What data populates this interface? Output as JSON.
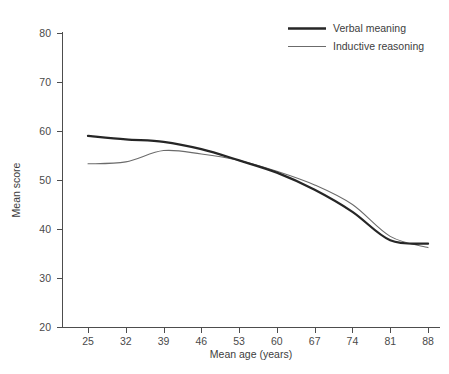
{
  "chart_data": {
    "type": "line",
    "title": "",
    "subtitle": "",
    "xlabel": "Mean age (years)",
    "ylabel": "Mean score",
    "x": [
      25,
      32,
      39,
      46,
      53,
      60,
      67,
      74,
      81,
      88
    ],
    "xtick_labels": [
      "25",
      "32",
      "39",
      "46",
      "53",
      "60",
      "67",
      "74",
      "81",
      "88"
    ],
    "ytick_labels": [
      "20",
      "30",
      "40",
      "50",
      "60",
      "70",
      "80"
    ],
    "yticks": [
      20,
      30,
      40,
      50,
      60,
      70,
      80
    ],
    "xlim": [
      25,
      88
    ],
    "ylim": [
      20,
      80
    ],
    "grid": false,
    "legend_position": "top-right",
    "series": [
      {
        "name": "Verbal meaning",
        "style": "thick",
        "color": "#262626",
        "values": [
          59.0,
          58.3,
          57.8,
          56.3,
          54.0,
          51.5,
          48.0,
          43.5,
          37.7,
          37.0
        ]
      },
      {
        "name": "Inductive reasoning",
        "style": "thin",
        "color": "#6b6b6b",
        "values": [
          53.3,
          53.7,
          56.0,
          55.3,
          54.0,
          51.8,
          49.0,
          45.0,
          38.5,
          36.2
        ]
      }
    ]
  },
  "legend": {
    "items": [
      {
        "label": "Verbal meaning"
      },
      {
        "label": "Inductive reasoning"
      }
    ]
  },
  "axes": {
    "x_title": "Mean age (years)",
    "y_title": "Mean score"
  }
}
